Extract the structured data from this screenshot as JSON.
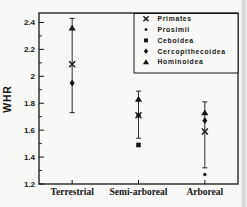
{
  "figure": {
    "background": "#f8f8f6",
    "ink": "#151515",
    "scan_edge_color": "#bdbdbd"
  },
  "chart_data": {
    "type": "scatter",
    "title": "",
    "xlabel": "",
    "ylabel": "WHR",
    "grid": false,
    "categories": [
      "Terrestrial",
      "Semi-arboreal",
      "Arboreal"
    ],
    "y_axis": {
      "min": 1.2,
      "max": 2.47,
      "major_ticks": [
        {
          "value": 1.2,
          "label": "1.2"
        },
        {
          "value": 1.4,
          "label": "1.4"
        },
        {
          "value": 1.6,
          "label": "1.6"
        },
        {
          "value": 1.8,
          "label": "1.8"
        },
        {
          "value": 2.0,
          "label": "2"
        },
        {
          "value": 2.2,
          "label": "2.2"
        },
        {
          "value": 2.4,
          "label": "2.4"
        }
      ],
      "minor_ticks": [
        1.3,
        1.5,
        1.7,
        1.9,
        2.1,
        2.3
      ]
    },
    "legend": {
      "position": "top-right",
      "entries": [
        "Primates",
        "Prosimii",
        "Ceboidea",
        "Cercopithecoidea",
        "Hominoidea"
      ]
    },
    "series": [
      {
        "name": "Primates",
        "marker": "x",
        "values": [
          2.09,
          1.71,
          1.59
        ],
        "error_low": [
          1.73,
          1.54,
          1.32
        ],
        "error_high": [
          2.43,
          1.89,
          1.81
        ]
      },
      {
        "name": "Prosimii",
        "marker": "dot",
        "values": [
          null,
          null,
          1.27
        ]
      },
      {
        "name": "Ceboidea",
        "marker": "square",
        "values": [
          null,
          1.49,
          null
        ]
      },
      {
        "name": "Cercopithecoidea",
        "marker": "diamond",
        "values": [
          1.95,
          1.71,
          1.67
        ]
      },
      {
        "name": "Hominoidea",
        "marker": "triangle",
        "values": [
          2.36,
          1.83,
          1.73
        ]
      }
    ]
  }
}
